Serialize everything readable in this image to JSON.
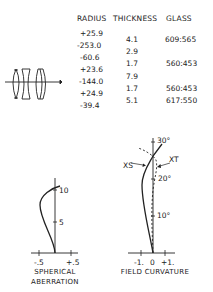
{
  "table": {
    "headers": {
      "radius": "RADIUS",
      "thickness": "THICKNESS",
      "glass": "GLASS"
    },
    "radius": [
      "+25.9",
      "-253.0",
      "-60.6",
      "+23.6",
      "-144.0",
      "+24.9",
      "-39.4"
    ],
    "thickness": [
      "4.1",
      "2.9",
      "1.7",
      "7.9",
      "1.7",
      "5.1"
    ],
    "glass": [
      "609:565",
      "560:453",
      "560:453",
      "617:550"
    ]
  },
  "spherical_aberration": {
    "title_line1": "SPHERICAL",
    "title_line2": "ABERRATION",
    "x_ticks": [
      "-.5",
      "+.5"
    ],
    "y_ticks": [
      "5",
      "10"
    ]
  },
  "field_curvature": {
    "title": "FIELD CURVATURE",
    "x_ticks": [
      "-1.",
      "0",
      "+1."
    ],
    "y_ticks": [
      "10°",
      "20°",
      "30°"
    ],
    "curve_labels": {
      "sagittal": "XS",
      "tangential": "XT"
    }
  }
}
